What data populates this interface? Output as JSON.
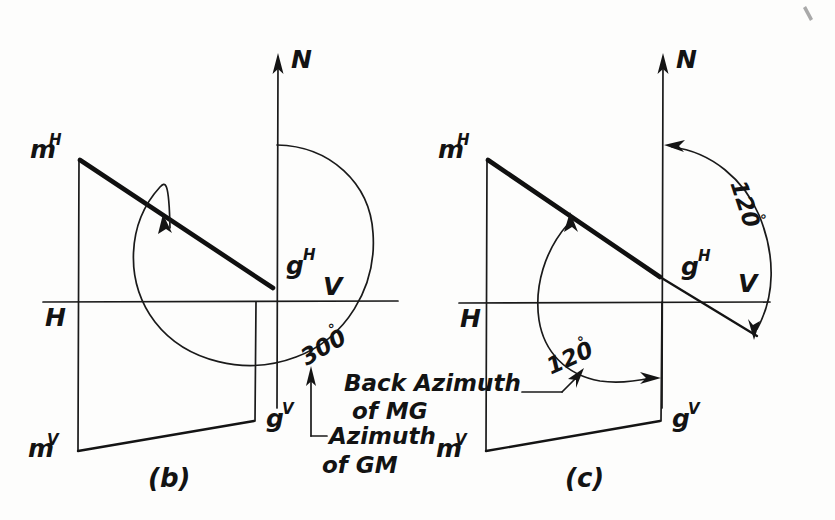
{
  "figure": {
    "background_color": "#fdfdfc",
    "ink_color": "#141414"
  },
  "panels": [
    {
      "id": "b",
      "caption": "(b)",
      "axis_north_label": "N",
      "plane_h_label": "H",
      "plane_v_label": "V",
      "point_labels": [
        {
          "base": "m",
          "sup": "H"
        },
        {
          "base": "g",
          "sup": "H"
        },
        {
          "base": "m",
          "sup": "V"
        },
        {
          "base": "g",
          "sup": "V"
        }
      ],
      "angle_labels": [
        {
          "value": "300",
          "degree": "°"
        }
      ],
      "notes": [
        {
          "line1": "Azimuth",
          "line2": "of GM"
        }
      ]
    },
    {
      "id": "c",
      "caption": "(c)",
      "axis_north_label": "N",
      "plane_h_label": "H",
      "plane_v_label": "V",
      "point_labels": [
        {
          "base": "m",
          "sup": "H"
        },
        {
          "base": "g",
          "sup": "H"
        },
        {
          "base": "m",
          "sup": "V"
        },
        {
          "base": "g",
          "sup": "V"
        }
      ],
      "angle_labels": [
        {
          "value": "120",
          "degree": "°"
        },
        {
          "value": "120",
          "degree": "°"
        }
      ],
      "notes": [
        {
          "line1": "Back Azimuth",
          "line2": "of MG"
        }
      ]
    }
  ],
  "panel_b": {
    "caption": "(b)",
    "north": "N",
    "h": "H",
    "v": "V",
    "m_h_base": "m",
    "m_h_sup": "H",
    "g_h_base": "g",
    "g_h_sup": "H",
    "m_v_base": "m",
    "m_v_sup": "V",
    "g_v_base": "g",
    "g_v_sup": "V",
    "angle": "300",
    "angle_degree": "°",
    "note_line1": "Azimuth",
    "note_line2": "of GM"
  },
  "panel_c": {
    "caption": "(c)",
    "north": "N",
    "h": "H",
    "v": "V",
    "m_h_base": "m",
    "m_h_sup": "H",
    "g_h_base": "g",
    "g_h_sup": "H",
    "m_v_base": "m",
    "m_v_sup": "V",
    "g_v_base": "g",
    "g_v_sup": "V",
    "angle_upper": "120",
    "angle_upper_degree": "°",
    "angle_lower": "120",
    "angle_lower_degree": "°",
    "note_line1": "Back Azimuth",
    "note_line2": "of MG"
  }
}
